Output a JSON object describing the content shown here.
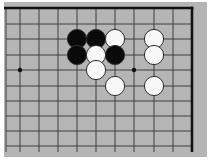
{
  "diagram": {
    "type": "go-board-problem",
    "width": 211,
    "height": 163,
    "colors": {
      "page_background": "#ffffff",
      "board": "#b5b5b5",
      "grid_line": "#3f3f3f",
      "board_edge": "#121212",
      "black_stone": "#0a0a0a",
      "white_stone_fill": "#f8f8f8",
      "stone_outline": "#2e2e2e",
      "star_point": "#111111"
    },
    "board_rect": {
      "x": 4,
      "y": 2,
      "width": 203,
      "height": 155
    },
    "grid": {
      "cols_x": [
        6,
        20,
        39,
        58,
        77,
        96,
        115,
        134,
        154,
        173,
        192
      ],
      "rows_y": [
        8,
        24,
        39,
        55,
        70,
        86,
        101,
        116,
        131,
        146
      ],
      "lines_top_y": 8,
      "lines_bottom_y": 152,
      "lines_left_x": 6,
      "lines_right_x": 192,
      "thin_line_width": 1,
      "edge_line_width": 2.6,
      "top_edge_row_index": 0,
      "right_edge_col_index": 10
    },
    "star_points": [
      {
        "col": 1,
        "row": 4
      },
      {
        "col": 7,
        "row": 4
      }
    ],
    "star_radius": 2.2,
    "stone_radius": 9.6,
    "stones": [
      {
        "color": "black",
        "col": 4,
        "row": 2
      },
      {
        "color": "black",
        "col": 5,
        "row": 2
      },
      {
        "color": "white",
        "col": 6,
        "row": 2
      },
      {
        "color": "white",
        "col": 8,
        "row": 2
      },
      {
        "color": "black",
        "col": 4,
        "row": 3
      },
      {
        "color": "white",
        "col": 5,
        "row": 3
      },
      {
        "color": "black",
        "col": 6,
        "row": 3
      },
      {
        "color": "white",
        "col": 8,
        "row": 3
      },
      {
        "color": "white",
        "col": 5,
        "row": 4
      },
      {
        "color": "white",
        "col": 6,
        "row": 5
      },
      {
        "color": "white",
        "col": 8,
        "row": 5
      }
    ],
    "counts": {
      "black_stones": 4,
      "white_stones": 7
    }
  }
}
